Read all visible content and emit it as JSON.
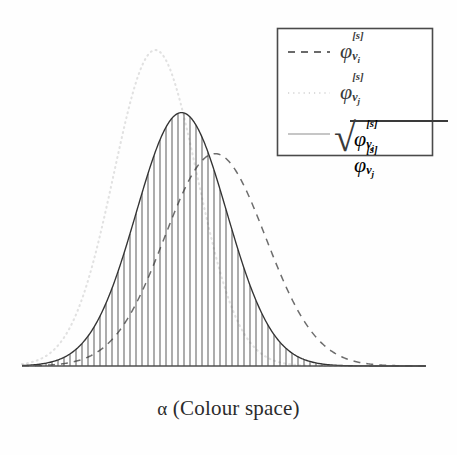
{
  "figure": {
    "caption": "α (Colour space)",
    "caption_symbol": "α",
    "caption_text": "(Colour space)",
    "background_color": "#fefefe",
    "axis_color": "#555555",
    "axis": {
      "x_start": 22,
      "x_end": 426,
      "y_baseline": 366
    }
  },
  "legend": {
    "box": {
      "x": 277,
      "y": 28,
      "width": 155,
      "height": 127,
      "border_color": "#4a4a4a"
    },
    "entries": [
      {
        "id": "phi-vi",
        "style": "dashed",
        "color": "#3a3a3a",
        "sample_x1": 288,
        "sample_x2": 330,
        "sample_y": 52,
        "phi": "φ",
        "superscript": "[s]",
        "subscript_base": "v",
        "subscript_index": "i"
      },
      {
        "id": "phi-vj",
        "style": "dotted",
        "color": "#dcdcdc",
        "sample_x1": 288,
        "sample_x2": 330,
        "sample_y": 93,
        "phi": "φ",
        "superscript": "[s]",
        "subscript_base": "v",
        "subscript_index": "j"
      },
      {
        "id": "sqrt-phi-vi-phi-vj",
        "style": "solid",
        "color": "#8a8a8a",
        "sample_x1": 288,
        "sample_x2": 330,
        "sample_y": 134,
        "sqrt": "√",
        "phi": "φ",
        "superscript": "[s]",
        "subscript_base": "v",
        "subscript_index_1": "i",
        "subscript_index_2": "j"
      }
    ]
  },
  "chart_data": {
    "type": "line",
    "title": "",
    "xlabel": "α (Colour space)",
    "ylabel": "",
    "grid": false,
    "legend_position": "top-right",
    "xlim": [
      0,
      1
    ],
    "ylim": [
      0,
      1
    ],
    "x": [
      0.0,
      0.05,
      0.1,
      0.15,
      0.2,
      0.25,
      0.3,
      0.35,
      0.4,
      0.45,
      0.5,
      0.55,
      0.6,
      0.65,
      0.7,
      0.75,
      0.8,
      0.85,
      0.9,
      0.95,
      1.0
    ],
    "series": [
      {
        "name": "φ_vi^[s]",
        "style": "dashed",
        "color": "#4a4a4a",
        "peak_x": 0.478,
        "peak_y": 0.672,
        "sigma": 0.125,
        "values": [
          0.0,
          0.0,
          0.001,
          0.004,
          0.015,
          0.045,
          0.11,
          0.225,
          0.383,
          0.545,
          0.651,
          0.669,
          0.596,
          0.455,
          0.3,
          0.17,
          0.082,
          0.034,
          0.012,
          0.004,
          0.001
        ]
      },
      {
        "name": "φ_vj^[s]",
        "style": "dotted",
        "color": "#e3e3e3",
        "peak_x": 0.33,
        "peak_y": 1.0,
        "sigma": 0.103,
        "values": [
          0.004,
          0.022,
          0.088,
          0.248,
          0.52,
          0.814,
          0.985,
          0.94,
          0.673,
          0.376,
          0.163,
          0.056,
          0.015,
          0.003,
          0.001,
          0.0,
          0.0,
          0.0,
          0.0,
          0.0,
          0.0
        ]
      },
      {
        "name": "sqrt(φ_vi^[s] φ_vj^[s])",
        "style": "solid-hatched",
        "color": "#3a3a3a",
        "hatch": "vertical",
        "hatch_spacing_px": 6,
        "peak_x": 0.395,
        "peak_y": 0.802,
        "sigma": 0.112,
        "values": [
          0.0,
          0.002,
          0.009,
          0.031,
          0.088,
          0.191,
          0.33,
          0.46,
          0.508,
          0.453,
          0.326,
          0.194,
          0.095,
          0.039,
          0.013,
          0.004,
          0.001,
          0.0,
          0.0,
          0.0,
          0.0
        ]
      }
    ]
  }
}
